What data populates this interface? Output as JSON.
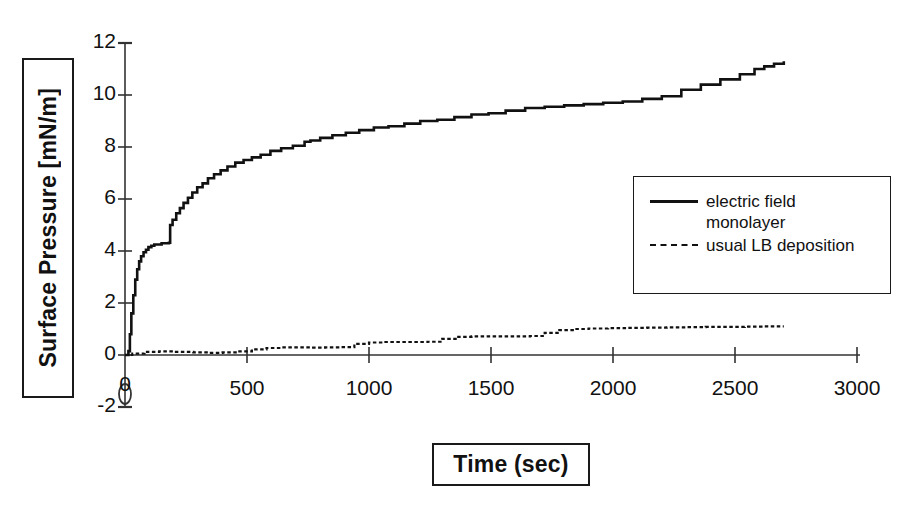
{
  "chart_data": {
    "type": "line",
    "title": "",
    "xlabel": "Time (sec)",
    "ylabel": "Surface Pressure [mN/m]",
    "xlim": [
      0,
      3000
    ],
    "ylim": [
      -2,
      12
    ],
    "xticks": [
      0,
      500,
      1000,
      1500,
      2000,
      2500,
      3000
    ],
    "xticklabels": [
      "0",
      "500",
      "1000",
      "1500",
      "2000",
      "2500",
      "3000"
    ],
    "yticks": [
      -2,
      0,
      2,
      4,
      6,
      8,
      10,
      12
    ],
    "yticklabels": [
      "-2",
      "0",
      "2",
      "4",
      "6",
      "8",
      "10",
      "12"
    ],
    "grid": false,
    "legend_position": "center-right",
    "series": [
      {
        "name": "electric field monolayer",
        "style": "solid",
        "color": "#111111",
        "points": [
          [
            0,
            0.0
          ],
          [
            8,
            0.0
          ],
          [
            14,
            0.15
          ],
          [
            20,
            0.8
          ],
          [
            26,
            1.6
          ],
          [
            34,
            2.3
          ],
          [
            42,
            2.9
          ],
          [
            50,
            3.3
          ],
          [
            58,
            3.6
          ],
          [
            66,
            3.8
          ],
          [
            76,
            3.95
          ],
          [
            86,
            4.05
          ],
          [
            96,
            4.15
          ],
          [
            108,
            4.2
          ],
          [
            120,
            4.25
          ],
          [
            150,
            4.3
          ],
          [
            175,
            4.3
          ],
          [
            180,
            4.32
          ],
          [
            185,
            5.0
          ],
          [
            195,
            5.2
          ],
          [
            210,
            5.45
          ],
          [
            225,
            5.65
          ],
          [
            240,
            5.85
          ],
          [
            258,
            6.05
          ],
          [
            276,
            6.25
          ],
          [
            296,
            6.45
          ],
          [
            318,
            6.6
          ],
          [
            340,
            6.8
          ],
          [
            365,
            6.95
          ],
          [
            392,
            7.1
          ],
          [
            420,
            7.25
          ],
          [
            452,
            7.4
          ],
          [
            486,
            7.5
          ],
          [
            520,
            7.6
          ],
          [
            556,
            7.7
          ],
          [
            596,
            7.85
          ],
          [
            640,
            7.95
          ],
          [
            688,
            8.05
          ],
          [
            736,
            8.2
          ],
          [
            760,
            8.25
          ],
          [
            800,
            8.35
          ],
          [
            850,
            8.45
          ],
          [
            905,
            8.55
          ],
          [
            960,
            8.65
          ],
          [
            1020,
            8.75
          ],
          [
            1080,
            8.8
          ],
          [
            1145,
            8.9
          ],
          [
            1210,
            9.0
          ],
          [
            1280,
            9.05
          ],
          [
            1350,
            9.15
          ],
          [
            1420,
            9.25
          ],
          [
            1490,
            9.3
          ],
          [
            1560,
            9.4
          ],
          [
            1640,
            9.5
          ],
          [
            1720,
            9.55
          ],
          [
            1800,
            9.6
          ],
          [
            1880,
            9.65
          ],
          [
            1960,
            9.7
          ],
          [
            2040,
            9.75
          ],
          [
            2120,
            9.85
          ],
          [
            2200,
            9.95
          ],
          [
            2280,
            10.2
          ],
          [
            2360,
            10.4
          ],
          [
            2440,
            10.6
          ],
          [
            2520,
            10.8
          ],
          [
            2580,
            11.0
          ],
          [
            2620,
            11.1
          ],
          [
            2660,
            11.2
          ],
          [
            2700,
            11.3
          ]
        ]
      },
      {
        "name": "usual LB deposition",
        "style": "dashed",
        "color": "#111111",
        "points": [
          [
            0,
            0.0
          ],
          [
            30,
            0.05
          ],
          [
            80,
            0.12
          ],
          [
            140,
            0.14
          ],
          [
            200,
            0.12
          ],
          [
            280,
            0.1
          ],
          [
            340,
            0.08
          ],
          [
            400,
            0.1
          ],
          [
            460,
            0.14
          ],
          [
            520,
            0.22
          ],
          [
            580,
            0.27
          ],
          [
            640,
            0.29
          ],
          [
            700,
            0.29
          ],
          [
            760,
            0.28
          ],
          [
            820,
            0.29
          ],
          [
            880,
            0.3
          ],
          [
            940,
            0.43
          ],
          [
            1000,
            0.48
          ],
          [
            1060,
            0.5
          ],
          [
            1120,
            0.5
          ],
          [
            1180,
            0.5
          ],
          [
            1240,
            0.51
          ],
          [
            1300,
            0.62
          ],
          [
            1360,
            0.7
          ],
          [
            1420,
            0.72
          ],
          [
            1480,
            0.72
          ],
          [
            1540,
            0.72
          ],
          [
            1600,
            0.72
          ],
          [
            1660,
            0.73
          ],
          [
            1720,
            0.85
          ],
          [
            1780,
            0.96
          ],
          [
            1840,
            1.0
          ],
          [
            1900,
            1.02
          ],
          [
            1980,
            1.03
          ],
          [
            2060,
            1.04
          ],
          [
            2140,
            1.05
          ],
          [
            2220,
            1.06
          ],
          [
            2300,
            1.07
          ],
          [
            2380,
            1.08
          ],
          [
            2460,
            1.08
          ],
          [
            2540,
            1.09
          ],
          [
            2620,
            1.1
          ],
          [
            2700,
            1.1
          ]
        ]
      }
    ]
  },
  "legend": {
    "entries": [
      {
        "label": "electric field\nmonolayer",
        "style": "solid"
      },
      {
        "label": "usual LB deposition",
        "style": "dashed"
      }
    ]
  },
  "axes": {
    "x_title": "Time (sec)",
    "y_title": "Surface Pressure [mN/m]"
  }
}
